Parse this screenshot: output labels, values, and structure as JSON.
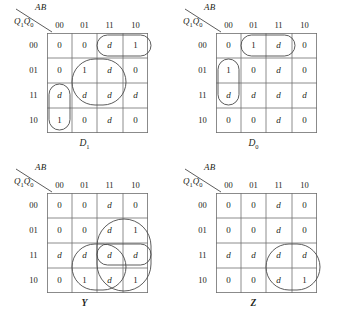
{
  "figure": {
    "axis_top_label": "AB",
    "axis_side_label_main": "Q",
    "axis_side_sub_1": "1",
    "axis_side_label_main2": "Q",
    "axis_side_sub_2": "0",
    "column_headers": [
      "00",
      "01",
      "11",
      "10"
    ],
    "row_headers": [
      "00",
      "01",
      "11",
      "10"
    ]
  },
  "maps": [
    {
      "id": "d1",
      "caption_main": "D",
      "caption_sub": "1",
      "caption_style": "italic",
      "rows": [
        [
          "0",
          "0",
          "d",
          "1"
        ],
        [
          "0",
          "1",
          "d",
          "0"
        ],
        [
          "d",
          "d",
          "d",
          "d"
        ],
        [
          "1",
          "0",
          "d",
          "0"
        ]
      ],
      "groups": [
        {
          "name": "oval-row00-col11-col10",
          "shape": "rounded",
          "x": 54,
          "y": 6,
          "w": 54,
          "h": 21
        },
        {
          "name": "box-rows01-11-cols01-11",
          "shape": "rounded",
          "x": 29,
          "y": 30,
          "w": 54,
          "h": 46
        },
        {
          "name": "oval-col00-rows11-10",
          "shape": "rounded",
          "x": 6,
          "y": 55,
          "w": 21,
          "h": 46
        }
      ]
    },
    {
      "id": "d0",
      "caption_main": "D",
      "caption_sub": "0",
      "caption_style": "italic",
      "rows": [
        [
          "0",
          "1",
          "d",
          "0"
        ],
        [
          "1",
          "0",
          "d",
          "0"
        ],
        [
          "d",
          "d",
          "d",
          "d"
        ],
        [
          "0",
          "0",
          "d",
          "0"
        ]
      ],
      "groups": [
        {
          "name": "oval-row00-col01-col11",
          "shape": "rounded",
          "x": 29,
          "y": 6,
          "w": 54,
          "h": 21
        },
        {
          "name": "oval-col00-rows01-11",
          "shape": "rounded",
          "x": 6,
          "y": 30,
          "w": 21,
          "h": 46
        }
      ]
    },
    {
      "id": "y",
      "caption_main": "Y",
      "caption_sub": "",
      "caption_style": "bold",
      "rows": [
        [
          "0",
          "0",
          "d",
          "0"
        ],
        [
          "0",
          "0",
          "d",
          "1"
        ],
        [
          "d",
          "d",
          "d",
          "d"
        ],
        [
          "0",
          "1",
          "d",
          "1"
        ]
      ],
      "groups": [
        {
          "name": "box-rows01-10-cols11-10",
          "shape": "rounded",
          "x": 54,
          "y": 30,
          "w": 54,
          "h": 72
        },
        {
          "name": "box-rows11-10-cols01-11",
          "shape": "rounded",
          "x": 29,
          "y": 55,
          "w": 54,
          "h": 46
        },
        {
          "name": "oval-row11-cols11-10",
          "shape": "rounded",
          "x": 54,
          "y": 55,
          "w": 54,
          "h": 21
        }
      ]
    },
    {
      "id": "z",
      "caption_main": "Z",
      "caption_sub": "",
      "caption_style": "bold",
      "rows": [
        [
          "0",
          "0",
          "d",
          "0"
        ],
        [
          "0",
          "0",
          "d",
          "0"
        ],
        [
          "d",
          "d",
          "d",
          "d"
        ],
        [
          "0",
          "0",
          "d",
          "1"
        ]
      ],
      "groups": [
        {
          "name": "box-rows11-10-cols11-10",
          "shape": "rounded",
          "x": 54,
          "y": 55,
          "w": 54,
          "h": 46
        }
      ]
    }
  ],
  "colors": {
    "ink": "#231f20",
    "grid_line": "#6f6f6f",
    "group_line": "#4a4a4a"
  }
}
